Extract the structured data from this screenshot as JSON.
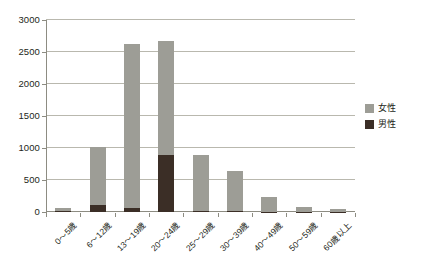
{
  "chart_data": {
    "type": "bar",
    "stacked": true,
    "title": "",
    "subtitle": "",
    "xlabel": "",
    "ylabel": "",
    "categories": [
      "0〜5歳",
      "6〜12歳",
      "13〜19歳",
      "20〜24歳",
      "25〜29歳",
      "30〜39歳",
      "40〜49歳",
      "50〜59歳",
      "60歳以上"
    ],
    "series": [
      {
        "name": "男性",
        "color": "#3b2e26",
        "values": [
          10,
          110,
          60,
          890,
          15,
          10,
          5,
          5,
          5
        ]
      },
      {
        "name": "女性",
        "color": "#9d9d96",
        "values": [
          50,
          910,
          2560,
          1780,
          880,
          630,
          225,
          80,
          35
        ]
      }
    ],
    "totals": [
      60,
      1020,
      2620,
      2670,
      895,
      640,
      230,
      85,
      40
    ],
    "ylim": [
      0,
      3000
    ],
    "yticks": [
      0,
      500,
      1000,
      1500,
      2000,
      2500,
      3000
    ],
    "ytick_labels": [
      "0",
      "500",
      "1000",
      "1500",
      "2000",
      "2500",
      "3000"
    ],
    "grid": true,
    "legend_position": "right",
    "legend_entries": [
      {
        "label": "女性",
        "color": "#9d9d96"
      },
      {
        "label": "男性",
        "color": "#3b2e26"
      }
    ]
  },
  "axis": {
    "y_line_color": "#8d8c82",
    "grid_color": "#b9b8ae"
  }
}
